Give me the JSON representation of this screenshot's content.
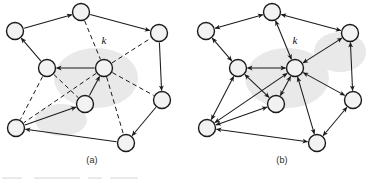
{
  "figure": {
    "width": 382,
    "height": 182,
    "background_color": "#ffffff",
    "node_fill_color": "#f2f2f2",
    "node_stroke_color": "#1a1a1a",
    "edge_color": "#1a1a1a",
    "node_radius": 8.5
  },
  "panels": [
    {
      "id": "a",
      "caption": "(a)",
      "hub_label": "k",
      "hub_label_position": {
        "x": 104,
        "y": 44
      },
      "nodes": [
        {
          "id": "n1",
          "x": 81,
          "y": 12
        },
        {
          "id": "n2",
          "x": 15,
          "y": 31
        },
        {
          "id": "n3",
          "x": 159,
          "y": 33
        },
        {
          "id": "n4",
          "x": 47,
          "y": 68
        },
        {
          "id": "n5",
          "x": 104,
          "y": 68,
          "is_hub": true
        },
        {
          "id": "n6",
          "x": 85,
          "y": 104
        },
        {
          "id": "n7",
          "x": 162,
          "y": 100
        },
        {
          "id": "n8",
          "x": 16,
          "y": 128
        },
        {
          "id": "n9",
          "x": 126,
          "y": 143
        }
      ],
      "edges": [
        {
          "from": "n2",
          "to": "n1",
          "style": "solid",
          "arrows": "forward"
        },
        {
          "from": "n1",
          "to": "n3",
          "style": "solid",
          "arrows": "forward"
        },
        {
          "from": "n4",
          "to": "n2",
          "style": "solid",
          "arrows": "forward"
        },
        {
          "from": "n5",
          "to": "n4",
          "style": "solid",
          "arrows": "forward"
        },
        {
          "from": "n3",
          "to": "n7",
          "style": "solid",
          "arrows": "forward"
        },
        {
          "from": "n6",
          "to": "n5",
          "style": "solid",
          "arrows": "forward"
        },
        {
          "from": "n8",
          "to": "n6",
          "style": "solid",
          "arrows": "forward"
        },
        {
          "from": "n9",
          "to": "n8",
          "style": "solid",
          "arrows": "forward"
        },
        {
          "from": "n7",
          "to": "n9",
          "style": "solid",
          "arrows": "forward"
        },
        {
          "from": "n1",
          "to": "n5",
          "style": "dashed",
          "arrows": "none"
        },
        {
          "from": "n5",
          "to": "n3",
          "style": "dashed",
          "arrows": "none"
        },
        {
          "from": "n5",
          "to": "n7",
          "style": "dashed",
          "arrows": "none"
        },
        {
          "from": "n5",
          "to": "n9",
          "style": "dashed",
          "arrows": "none"
        },
        {
          "from": "n5",
          "to": "n8",
          "style": "dashed",
          "arrows": "none"
        },
        {
          "from": "n4",
          "to": "n6",
          "style": "dashed",
          "arrows": "none"
        },
        {
          "from": "n4",
          "to": "n8",
          "style": "dashed",
          "arrows": "none"
        }
      ]
    },
    {
      "id": "b",
      "caption": "(b)",
      "hub_label": "k",
      "hub_label_position": {
        "x": 295,
        "y": 44
      },
      "nodes": [
        {
          "id": "m1",
          "x": 272,
          "y": 12
        },
        {
          "id": "m2",
          "x": 206,
          "y": 31
        },
        {
          "id": "m3",
          "x": 350,
          "y": 33
        },
        {
          "id": "m4",
          "x": 238,
          "y": 68
        },
        {
          "id": "m5",
          "x": 295,
          "y": 68,
          "is_hub": true
        },
        {
          "id": "m6",
          "x": 276,
          "y": 104
        },
        {
          "id": "m7",
          "x": 353,
          "y": 100
        },
        {
          "id": "m8",
          "x": 207,
          "y": 128
        },
        {
          "id": "m9",
          "x": 317,
          "y": 143
        }
      ],
      "edges": [
        {
          "from": "m2",
          "to": "m1",
          "style": "solid",
          "arrows": "both"
        },
        {
          "from": "m1",
          "to": "m3",
          "style": "solid",
          "arrows": "both"
        },
        {
          "from": "m4",
          "to": "m2",
          "style": "solid",
          "arrows": "both"
        },
        {
          "from": "m5",
          "to": "m4",
          "style": "solid",
          "arrows": "both"
        },
        {
          "from": "m3",
          "to": "m7",
          "style": "solid",
          "arrows": "both"
        },
        {
          "from": "m6",
          "to": "m5",
          "style": "solid",
          "arrows": "both"
        },
        {
          "from": "m8",
          "to": "m6",
          "style": "solid",
          "arrows": "both"
        },
        {
          "from": "m9",
          "to": "m8",
          "style": "solid",
          "arrows": "both"
        },
        {
          "from": "m7",
          "to": "m9",
          "style": "solid",
          "arrows": "both"
        },
        {
          "from": "m1",
          "to": "m5",
          "style": "solid",
          "arrows": "both"
        },
        {
          "from": "m5",
          "to": "m3",
          "style": "solid",
          "arrows": "both"
        },
        {
          "from": "m5",
          "to": "m7",
          "style": "solid",
          "arrows": "both"
        },
        {
          "from": "m5",
          "to": "m9",
          "style": "solid",
          "arrows": "both"
        },
        {
          "from": "m5",
          "to": "m8",
          "style": "solid",
          "arrows": "both"
        },
        {
          "from": "m4",
          "to": "m6",
          "style": "solid",
          "arrows": "both"
        },
        {
          "from": "m4",
          "to": "m8",
          "style": "solid",
          "arrows": "both"
        }
      ]
    }
  ]
}
